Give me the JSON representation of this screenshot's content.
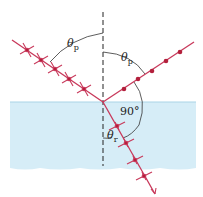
{
  "figure": {
    "colors": {
      "water": "#d6edf7",
      "water_edge": "#a9d4e6",
      "ray": "#c8385a",
      "dot": "#b3203c",
      "normal": "#222222",
      "arc": "#333333"
    },
    "labels": {
      "incident_angle": {
        "symbol": "θ",
        "subscript": "p"
      },
      "reflected_angle": {
        "symbol": "θ",
        "subscript": "p"
      },
      "right_angle": "90°",
      "refracted_angle": {
        "symbol": "θ",
        "subscript": "r"
      }
    },
    "rays": {
      "incident": {
        "name": "incident ray",
        "polarization": "mixed (arrows + dots)",
        "markers": 5
      },
      "reflected": {
        "name": "reflected ray",
        "polarization": "perpendicular (dots only)",
        "markers": 5
      },
      "refracted": {
        "name": "refracted ray",
        "polarization": "mixed (arrows + dots)",
        "markers": 4
      }
    }
  }
}
